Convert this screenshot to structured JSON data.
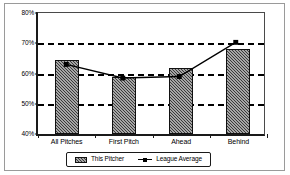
{
  "chart_data": {
    "type": "bar",
    "title": "",
    "subtitle": "",
    "xlabel": "",
    "ylabel": "",
    "categories": [
      "All Pitches",
      "First Pitch",
      "Ahead",
      "Behind"
    ],
    "series": [
      {
        "name": "This Pitcher",
        "type": "bar",
        "values": [
          64.5,
          58.7,
          61.7,
          68.0
        ]
      },
      {
        "name": "League Average",
        "type": "line",
        "values": [
          63.0,
          58.5,
          59.0,
          70.3
        ]
      }
    ],
    "ylim": [
      40,
      80
    ],
    "yticks": [
      40,
      50,
      60,
      70,
      80
    ],
    "ytick_labels": [
      "40%",
      "50%",
      "60%",
      "70%",
      "80%"
    ],
    "grid": true,
    "gridlines_at": [
      50,
      60,
      70
    ],
    "legend_position": "bottom",
    "colors": {
      "bar_fill": "#3a3a3a",
      "bar_border": "#111111",
      "line": "#000000",
      "axis": "#1a1a1a",
      "grid": "#000000",
      "frame": "#9a9a9a",
      "background": "#ffffff"
    }
  },
  "legend": {
    "items": [
      {
        "label": "This Pitcher",
        "marker": "hatched-bar-swatch"
      },
      {
        "label": "League Average",
        "marker": "line-with-square-marker"
      }
    ]
  },
  "axes": {
    "y": {
      "ticks": [
        {
          "label": "80%",
          "value": 80
        },
        {
          "label": "70%",
          "value": 70
        },
        {
          "label": "60%",
          "value": 60
        },
        {
          "label": "50%",
          "value": 50
        },
        {
          "label": "40%",
          "value": 40
        }
      ]
    },
    "x": {
      "ticks": [
        {
          "label": "All Pitches"
        },
        {
          "label": "First Pitch"
        },
        {
          "label": "Ahead"
        },
        {
          "label": "Behind"
        }
      ]
    }
  }
}
